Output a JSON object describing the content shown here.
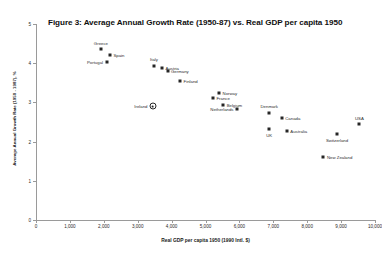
{
  "figure": {
    "title": "Figure 3: Average Annual Growth Rate (1950-87) vs. Real GDP per capita 1950"
  },
  "chart_data": {
    "type": "scatter",
    "title": "Figure 3: Average Annual Growth Rate (1950-87) vs. Real GDP per capita 1950",
    "xlabel": "Real GDP per capita 1950 (1990 Intl. $)",
    "ylabel": "Average Annual Growth Rate (1950 - 1987), %",
    "xlim": [
      0,
      10000
    ],
    "ylim": [
      0,
      5
    ],
    "xticks": [
      0,
      1000,
      2000,
      3000,
      4000,
      5000,
      6000,
      7000,
      8000,
      9000,
      10000
    ],
    "xtick_labels": [
      "0",
      "1,000",
      "2,000",
      "3,000",
      "4,000",
      "5,000",
      "6,000",
      "7,000",
      "8,000",
      "9,000",
      "10,000"
    ],
    "yticks": [
      0,
      1,
      2,
      3,
      4,
      5
    ],
    "ytick_labels": [
      "0",
      "1",
      "2",
      "3",
      "4",
      "5"
    ],
    "grid": false,
    "legend": false,
    "points": [
      {
        "name": "Greece",
        "x": 1915,
        "y": 4.35,
        "marker": "filled",
        "label_pos": "above"
      },
      {
        "name": "Spain",
        "x": 2180,
        "y": 4.21,
        "marker": "filled",
        "label_pos": "right"
      },
      {
        "name": "Portugal",
        "x": 2080,
        "y": 4.04,
        "marker": "filled",
        "label_pos": "left"
      },
      {
        "name": "Italy",
        "x": 3480,
        "y": 3.94,
        "marker": "filled",
        "label_pos": "above"
      },
      {
        "name": "Austria",
        "x": 3720,
        "y": 3.88,
        "marker": "filled",
        "label_pos": "right"
      },
      {
        "name": "Germany",
        "x": 3880,
        "y": 3.79,
        "marker": "filled",
        "label_pos": "right"
      },
      {
        "name": "Finland",
        "x": 4250,
        "y": 3.54,
        "marker": "filled",
        "label_pos": "right"
      },
      {
        "name": "Norway",
        "x": 5400,
        "y": 3.25,
        "marker": "filled",
        "label_pos": "right"
      },
      {
        "name": "France",
        "x": 5220,
        "y": 3.1,
        "marker": "filled",
        "label_pos": "right"
      },
      {
        "name": "Belgium",
        "x": 5520,
        "y": 2.94,
        "marker": "filled",
        "label_pos": "right"
      },
      {
        "name": "Ireland",
        "x": 3450,
        "y": 2.9,
        "marker": "hollow",
        "label_pos": "left"
      },
      {
        "name": "Netherlands",
        "x": 5930,
        "y": 2.84,
        "marker": "filled",
        "label_pos": "left"
      },
      {
        "name": "Denmark",
        "x": 6880,
        "y": 2.74,
        "marker": "filled",
        "label_pos": "above"
      },
      {
        "name": "Canada",
        "x": 7250,
        "y": 2.59,
        "marker": "filled",
        "label_pos": "right"
      },
      {
        "name": "USA",
        "x": 9540,
        "y": 2.44,
        "marker": "filled",
        "label_pos": "above"
      },
      {
        "name": "UK",
        "x": 6880,
        "y": 2.31,
        "marker": "filled",
        "label_pos": "below"
      },
      {
        "name": "Australia",
        "x": 7400,
        "y": 2.26,
        "marker": "filled",
        "label_pos": "right"
      },
      {
        "name": "Switzerland",
        "x": 8880,
        "y": 2.2,
        "marker": "filled",
        "label_pos": "below"
      },
      {
        "name": "New Zealand",
        "x": 8480,
        "y": 1.61,
        "marker": "filled",
        "label_pos": "right"
      }
    ]
  }
}
